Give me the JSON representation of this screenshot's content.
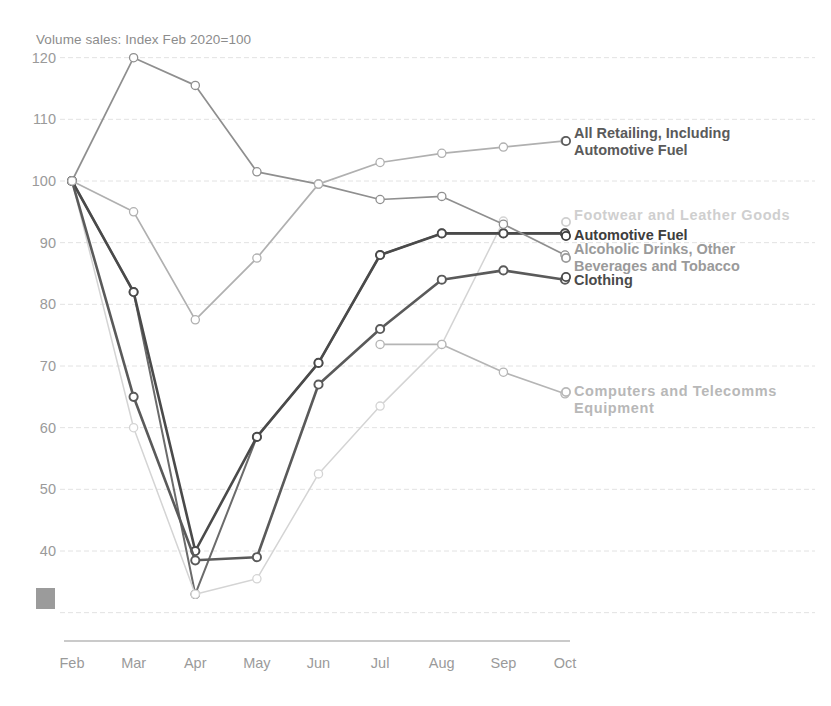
{
  "chart_data": {
    "type": "line",
    "title": "Volume sales: Index Feb 2020=100",
    "xlabel": "",
    "ylabel": "",
    "categories": [
      "Feb",
      "Mar",
      "Apr",
      "May",
      "Jun",
      "Jul",
      "Aug",
      "Sep",
      "Oct"
    ],
    "ylim": [
      30,
      120
    ],
    "yticks": [
      40,
      50,
      60,
      70,
      80,
      90,
      100,
      110,
      120
    ],
    "grid": true,
    "legend_position": "right-inline",
    "series": [
      {
        "name": "All Retailing, Including Automotive Fuel",
        "color": "#6b6b6b",
        "width": 2.0,
        "values": [
          100,
          82,
          33,
          58.5,
          70.5,
          88,
          91.5,
          91.5,
          91.5
        ]
      },
      {
        "name": "Footwear and Leather Goods",
        "color": "#d4d4d4",
        "width": 1.5,
        "values": [
          100,
          60,
          33,
          35.5,
          52.5,
          63.5,
          73.5,
          93.5,
          null
        ]
      },
      {
        "name": "Automotive Fuel",
        "color": "#4a4a4a",
        "width": 2.6,
        "values": [
          100,
          82,
          40,
          58.5,
          70.5,
          88,
          91.5,
          91.5,
          91.5
        ]
      },
      {
        "name": "Alcoholic Drinks, Other Beverages and Tobacco",
        "color": "#8f8f8f",
        "width": 1.7,
        "values": [
          100,
          120,
          115.5,
          101.5,
          99.5,
          97,
          97.5,
          93,
          88
        ]
      },
      {
        "name": "Clothing",
        "color": "#5a5a5a",
        "width": 2.6,
        "values": [
          100,
          65,
          38.5,
          39,
          67,
          76,
          84,
          85.5,
          84
        ]
      },
      {
        "name": "Computers and Telecomms Equipment",
        "color": "#b0b0b0",
        "width": 1.7,
        "values": [
          100,
          95,
          77.5,
          87.5,
          99.5,
          103,
          104.5,
          105.5,
          106.5
        ]
      },
      {
        "name": "Computers and Telecomms Equipment Lower",
        "color": "#b5b5b5",
        "width": 1.7,
        "values": [
          null,
          null,
          null,
          null,
          null,
          73.5,
          73.5,
          69,
          65.5
        ]
      }
    ],
    "legend": [
      {
        "id": "all-retailing",
        "lines": [
          "All Retailing, Including",
          "Automotive Fuel"
        ],
        "color": "#5a5a5a",
        "bold": true,
        "x": 574,
        "y": 134,
        "marker_x": 566,
        "marker_y": 141
      },
      {
        "id": "footwear",
        "lines": [
          "Footwear and Leather Goods"
        ],
        "color": "#cfcfcf",
        "bold": false,
        "x": 574,
        "y": 216,
        "marker_x": 566,
        "marker_y": 222
      },
      {
        "id": "automotive-fuel",
        "lines": [
          "Automotive Fuel"
        ],
        "color": "#3d3d3d",
        "bold": true,
        "x": 574,
        "y": 236,
        "marker_x": 566,
        "marker_y": 236
      },
      {
        "id": "alcoholic-drinks",
        "lines": [
          "Alcoholic Drinks, Other",
          "Beverages and Tobacco"
        ],
        "color": "#9a9a9a",
        "bold": true,
        "x": 574,
        "y": 250,
        "marker_x": 566,
        "marker_y": 258
      },
      {
        "id": "clothing",
        "lines": [
          "Clothing"
        ],
        "color": "#4a4a4a",
        "bold": true,
        "x": 574,
        "y": 281,
        "marker_x": 566,
        "marker_y": 277
      },
      {
        "id": "computers-telecomms",
        "lines": [
          "Computers and Telecomms",
          "Equipment"
        ],
        "color": "#b8b8b8",
        "bold": false,
        "x": 574,
        "y": 392,
        "marker_x": 566,
        "marker_y": 392
      }
    ]
  }
}
